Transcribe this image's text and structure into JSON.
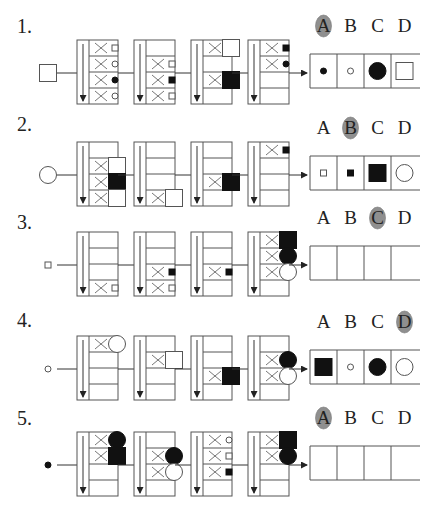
{
  "colors": {
    "line": "#555555",
    "shape_fill": "#111111",
    "answer_highlight": "#8f8f8f",
    "background": "#ffffff"
  },
  "option_letters": [
    "A",
    "B",
    "C",
    "D"
  ],
  "questions": [
    {
      "number": "1.",
      "input": {
        "shape": "square",
        "size": "large",
        "fill": "hollow"
      },
      "answer": "A",
      "panels": [
        {
          "rows": [
            {
              "x": true,
              "shape": "square",
              "size": "tiny",
              "fill": "hollow"
            },
            {
              "x": true,
              "shape": "circle",
              "size": "tiny",
              "fill": "hollow"
            },
            {
              "x": true,
              "shape": "circle",
              "size": "tiny",
              "fill": "solid"
            },
            {
              "x": true,
              "shape": "circle",
              "size": "tiny",
              "fill": "hollow"
            }
          ]
        },
        {
          "rows": [
            {
              "x": false,
              "shape": null
            },
            {
              "x": true,
              "shape": "square",
              "size": "tiny",
              "fill": "hollow"
            },
            {
              "x": true,
              "shape": "square",
              "size": "tiny",
              "fill": "solid"
            },
            {
              "x": true,
              "shape": "square",
              "size": "tiny",
              "fill": "hollow"
            }
          ]
        },
        {
          "rows": [
            {
              "x": true,
              "shape": "square",
              "size": "large",
              "fill": "hollow"
            },
            {
              "x": false,
              "shape": null
            },
            {
              "x": true,
              "shape": "square",
              "size": "large",
              "fill": "solid"
            },
            {
              "x": false,
              "shape": null
            }
          ]
        },
        {
          "rows": [
            {
              "x": true,
              "shape": "square",
              "size": "tiny",
              "fill": "solid"
            },
            {
              "x": true,
              "shape": "circle",
              "size": "tiny",
              "fill": "solid"
            },
            {
              "x": false,
              "shape": null
            },
            {
              "x": false,
              "shape": null
            }
          ]
        }
      ],
      "options": [
        {
          "letter": "A",
          "shape": "circle",
          "size": "tiny",
          "fill": "solid"
        },
        {
          "letter": "B",
          "shape": "circle",
          "size": "tiny",
          "fill": "hollow"
        },
        {
          "letter": "C",
          "shape": "circle",
          "size": "large",
          "fill": "solid"
        },
        {
          "letter": "D",
          "shape": "square",
          "size": "large",
          "fill": "hollow"
        }
      ]
    },
    {
      "number": "2.",
      "input": {
        "shape": "circle",
        "size": "large",
        "fill": "hollow"
      },
      "answer": "B",
      "panels": [
        {
          "rows": [
            {
              "x": false,
              "shape": null
            },
            {
              "x": true,
              "shape": "square",
              "size": "large",
              "fill": "hollow"
            },
            {
              "x": true,
              "shape": "square",
              "size": "large",
              "fill": "solid"
            },
            {
              "x": true,
              "shape": "square",
              "size": "large",
              "fill": "hollow"
            }
          ]
        },
        {
          "rows": [
            {
              "x": false,
              "shape": null
            },
            {
              "x": false,
              "shape": null
            },
            {
              "x": false,
              "shape": null
            },
            {
              "x": true,
              "shape": "square",
              "size": "large",
              "fill": "hollow"
            }
          ]
        },
        {
          "rows": [
            {
              "x": false,
              "shape": null
            },
            {
              "x": false,
              "shape": null
            },
            {
              "x": true,
              "shape": "square",
              "size": "large",
              "fill": "solid"
            },
            {
              "x": false,
              "shape": null
            }
          ]
        },
        {
          "rows": [
            {
              "x": true,
              "shape": "square",
              "size": "tiny",
              "fill": "solid"
            },
            {
              "x": false,
              "shape": null
            },
            {
              "x": false,
              "shape": null
            },
            {
              "x": false,
              "shape": null
            }
          ]
        }
      ],
      "options": [
        {
          "letter": "A",
          "shape": "square",
          "size": "tiny",
          "fill": "hollow"
        },
        {
          "letter": "B",
          "shape": "square",
          "size": "tiny",
          "fill": "solid"
        },
        {
          "letter": "C",
          "shape": "square",
          "size": "large",
          "fill": "solid"
        },
        {
          "letter": "D",
          "shape": "circle",
          "size": "large",
          "fill": "hollow"
        }
      ]
    },
    {
      "number": "3.",
      "input": {
        "shape": "square",
        "size": "tiny",
        "fill": "hollow"
      },
      "answer": "C",
      "panels": [
        {
          "rows": [
            {
              "x": false,
              "shape": null
            },
            {
              "x": false,
              "shape": null
            },
            {
              "x": false,
              "shape": null
            },
            {
              "x": true,
              "shape": "square",
              "size": "tiny",
              "fill": "hollow"
            }
          ]
        },
        {
          "rows": [
            {
              "x": false,
              "shape": null
            },
            {
              "x": false,
              "shape": null
            },
            {
              "x": true,
              "shape": "square",
              "size": "tiny",
              "fill": "solid"
            },
            {
              "x": true,
              "shape": "square",
              "size": "tiny",
              "fill": "hollow"
            }
          ]
        },
        {
          "rows": [
            {
              "x": false,
              "shape": null
            },
            {
              "x": false,
              "shape": null
            },
            {
              "x": true,
              "shape": "square",
              "size": "tiny",
              "fill": "solid"
            },
            {
              "x": false,
              "shape": null
            }
          ]
        },
        {
          "rows": [
            {
              "x": true,
              "shape": "square",
              "size": "large",
              "fill": "solid"
            },
            {
              "x": true,
              "shape": "circle",
              "size": "large",
              "fill": "solid"
            },
            {
              "x": true,
              "shape": "circle",
              "size": "large",
              "fill": "hollow"
            },
            {
              "x": false,
              "shape": null
            }
          ]
        }
      ],
      "options": [
        {
          "letter": "A",
          "shape": null
        },
        {
          "letter": "B",
          "shape": null
        },
        {
          "letter": "C",
          "shape": null
        },
        {
          "letter": "D",
          "shape": null
        }
      ]
    },
    {
      "number": "4.",
      "input": {
        "shape": "circle",
        "size": "tiny",
        "fill": "hollow"
      },
      "answer": "D",
      "panels": [
        {
          "rows": [
            {
              "x": true,
              "shape": "circle",
              "size": "large",
              "fill": "hollow"
            },
            {
              "x": false,
              "shape": null
            },
            {
              "x": false,
              "shape": null
            },
            {
              "x": false,
              "shape": null
            }
          ]
        },
        {
          "rows": [
            {
              "x": false,
              "shape": null
            },
            {
              "x": true,
              "shape": "square",
              "size": "large",
              "fill": "hollow"
            },
            {
              "x": false,
              "shape": null
            },
            {
              "x": false,
              "shape": null
            }
          ]
        },
        {
          "rows": [
            {
              "x": false,
              "shape": null
            },
            {
              "x": false,
              "shape": null
            },
            {
              "x": true,
              "shape": "square",
              "size": "large",
              "fill": "solid"
            },
            {
              "x": false,
              "shape": null
            }
          ]
        },
        {
          "rows": [
            {
              "x": false,
              "shape": null
            },
            {
              "x": true,
              "shape": "circle",
              "size": "large",
              "fill": "solid"
            },
            {
              "x": true,
              "shape": "circle",
              "size": "large",
              "fill": "hollow"
            },
            {
              "x": false,
              "shape": null
            }
          ]
        }
      ],
      "options": [
        {
          "letter": "A",
          "shape": "square",
          "size": "large",
          "fill": "solid"
        },
        {
          "letter": "B",
          "shape": "circle",
          "size": "tiny",
          "fill": "hollow"
        },
        {
          "letter": "C",
          "shape": "circle",
          "size": "large",
          "fill": "solid"
        },
        {
          "letter": "D",
          "shape": "circle",
          "size": "large",
          "fill": "hollow"
        }
      ]
    },
    {
      "number": "5.",
      "input": {
        "shape": "circle",
        "size": "tiny",
        "fill": "solid"
      },
      "answer": "A",
      "panels": [
        {
          "rows": [
            {
              "x": true,
              "shape": "circle",
              "size": "large",
              "fill": "solid"
            },
            {
              "x": true,
              "shape": "square",
              "size": "large",
              "fill": "solid"
            },
            {
              "x": false,
              "shape": null
            },
            {
              "x": false,
              "shape": null
            }
          ]
        },
        {
          "rows": [
            {
              "x": false,
              "shape": null
            },
            {
              "x": true,
              "shape": "circle",
              "size": "large",
              "fill": "solid"
            },
            {
              "x": true,
              "shape": "circle",
              "size": "large",
              "fill": "hollow"
            },
            {
              "x": false,
              "shape": null
            }
          ]
        },
        {
          "rows": [
            {
              "x": true,
              "shape": "circle",
              "size": "tiny",
              "fill": "hollow"
            },
            {
              "x": true,
              "shape": "square",
              "size": "tiny",
              "fill": "hollow"
            },
            {
              "x": true,
              "shape": "square",
              "size": "tiny",
              "fill": "solid"
            },
            {
              "x": false,
              "shape": null
            }
          ]
        },
        {
          "rows": [
            {
              "x": true,
              "shape": "square",
              "size": "large",
              "fill": "solid"
            },
            {
              "x": true,
              "shape": "circle",
              "size": "large",
              "fill": "solid"
            },
            {
              "x": false,
              "shape": null
            },
            {
              "x": false,
              "shape": null
            }
          ]
        }
      ],
      "options": [
        {
          "letter": "A",
          "shape": null
        },
        {
          "letter": "B",
          "shape": null
        },
        {
          "letter": "C",
          "shape": null
        },
        {
          "letter": "D",
          "shape": null
        }
      ]
    }
  ]
}
